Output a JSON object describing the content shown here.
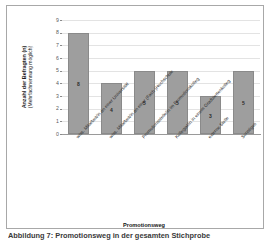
{
  "figure": {
    "caption": "Abbildung 7: Promotionsweg  in  der  gesamten  Stichprobe",
    "border_color": "#a8a8a8"
  },
  "chart_data": {
    "type": "bar",
    "title": "",
    "xlabel": "Promotionsweg",
    "ylabel_main": "Anzahl der Befragten (n)",
    "ylabel_sub": "(Mehrfachnennung möglich)",
    "categories": [
      "wiss. Mitarbeit/in an einer Universität",
      "wiss. Mitarbeit/in an einer (Fach-)Hochschule",
      "Promotionsstelle/in im Promotionskolleg",
      "Kollegiat/in in einem Graduiertenkolleg",
      "externe Stelle",
      "Sonstiges"
    ],
    "values": [
      8,
      4,
      5,
      5,
      3,
      5
    ],
    "data_labels": [
      "8",
      "4",
      "5",
      "5",
      "3",
      "5"
    ],
    "ylim": [
      0,
      9
    ],
    "yticks": [
      "0",
      "1",
      "2",
      "3",
      "4",
      "5",
      "6",
      "7",
      "8",
      "9"
    ],
    "grid": true,
    "legend": "none",
    "bar_color": "#9e9e9e"
  }
}
